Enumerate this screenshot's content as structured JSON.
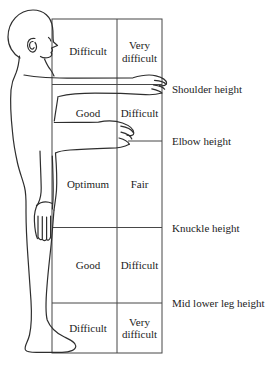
{
  "diagram": {
    "figure_icon": "standing-human-side-profile",
    "colors": {
      "ink": "#2e2e2e",
      "grid": "#474747",
      "paper": "#ffffff"
    },
    "grid": {
      "rows": [
        {
          "left": "Difficult",
          "right": "Very difficult"
        },
        {
          "left": "Good",
          "right": "Difficult"
        },
        {
          "left": "Optimum",
          "right": "Fair"
        },
        {
          "left": "Good",
          "right": "Difficult"
        },
        {
          "left": "Difficult",
          "right": "Very difficult"
        }
      ]
    },
    "height_labels": [
      {
        "text": "Shoulder height"
      },
      {
        "text": "Elbow height"
      },
      {
        "text": "Knuckle height"
      },
      {
        "text": "Mid lower leg height"
      }
    ]
  }
}
